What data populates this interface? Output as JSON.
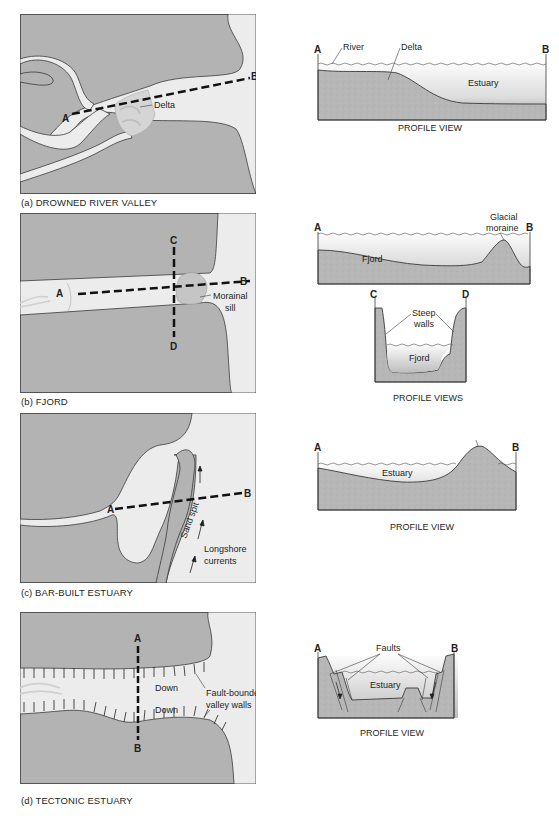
{
  "colors": {
    "land": "#b3b3b3",
    "water": "#ececec",
    "sediment": "#b9b9b9",
    "outline": "#3a3a3a",
    "dash": "#111111",
    "text": "#231f20"
  },
  "panels": [
    {
      "id": "a",
      "caption": "(a) DROWNED RIVER VALLEY",
      "map": {
        "points": {
          "A": "A",
          "B": "B"
        },
        "labels": {
          "delta": "Delta"
        }
      },
      "profile": {
        "points": {
          "A": "A",
          "B": "B"
        },
        "labels": {
          "river": "River",
          "delta": "Delta",
          "estuary": "Estuary"
        },
        "view_label": "PROFILE VIEW"
      }
    },
    {
      "id": "b",
      "caption": "(b) FJORD",
      "map": {
        "points": {
          "A": "A",
          "B": "B",
          "C": "C",
          "D": "D"
        },
        "labels": {
          "morainal_sill_1": "Morainal",
          "morainal_sill_2": "sill"
        }
      },
      "profile": {
        "points": {
          "A": "A",
          "B": "B",
          "C": "C",
          "D": "D"
        },
        "labels": {
          "glacial_moraine_1": "Glacial",
          "glacial_moraine_2": "moraine",
          "fjord": "Fjord",
          "steep_walls_1": "Steep",
          "steep_walls_2": "walls",
          "fjord_cross": "Fjord"
        },
        "view_label": "PROFILE VIEWS"
      }
    },
    {
      "id": "c",
      "caption": "(c) BAR-BUILT ESTUARY",
      "map": {
        "points": {
          "A": "A",
          "B": "B"
        },
        "labels": {
          "sand_spit": "Sand spit",
          "longshore_1": "Longshore",
          "longshore_2": "currents"
        }
      },
      "profile": {
        "points": {
          "A": "A",
          "B": "B"
        },
        "labels": {
          "sand_spit": "Sand spit",
          "estuary": "Estuary"
        },
        "view_label": "PROFILE VIEW"
      }
    },
    {
      "id": "d",
      "caption": "(d) TECTONIC ESTUARY",
      "map": {
        "points": {
          "A": "A",
          "B": "B"
        },
        "labels": {
          "down_1": "Down",
          "down_2": "Down",
          "fault_1": "Fault-bounded",
          "fault_2": "valley walls"
        }
      },
      "profile": {
        "points": {
          "A": "A",
          "B": "B"
        },
        "labels": {
          "faults": "Faults",
          "estuary": "Estuary"
        },
        "view_label": "PROFILE VIEW"
      }
    }
  ]
}
